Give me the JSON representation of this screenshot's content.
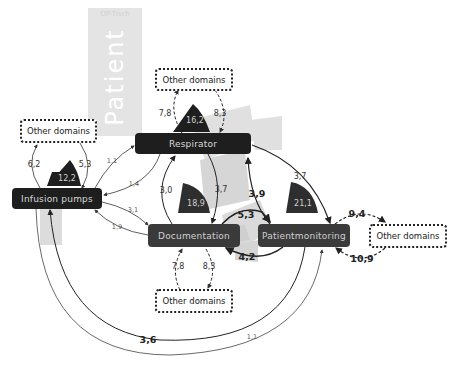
{
  "background_labels": {
    "patient": "Patient",
    "table": "OP-Tisch"
  },
  "nodes": {
    "infusion_pumps": "Infusion pumps",
    "respirator": "Respirator",
    "documentation": "Documentation",
    "patientmonitoring": "Patientmonitoring"
  },
  "other_domains": {
    "top": "Other domains",
    "left": "Other domains",
    "bottom": "Other domains",
    "right": "Other domains"
  },
  "self_values": {
    "infusion_pumps": "12,2",
    "respirator": "16,2",
    "documentation": "18,9",
    "patientmonitoring": "21,1"
  },
  "edges": {
    "other_to_respirator_out": "7,8",
    "other_to_respirator_in": "8,3",
    "infusion_to_other_out": "6,2",
    "infusion_from_other_in": "5,3",
    "infusion_to_respirator": "1,1",
    "respirator_to_infusion": "1,4",
    "infusion_to_documentation": "3,1",
    "documentation_to_infusion": "1,9",
    "documentation_to_respirator": "3,0",
    "respirator_to_documentation": "3,7",
    "patientmonitoring_to_respirator": "3,9",
    "respirator_to_patientmonitoring": "3,7",
    "documentation_to_patientmonitoring": "5,3",
    "patientmonitoring_to_documentation": "4,2",
    "documentation_to_other_out": "7,8",
    "documentation_from_other_in": "8,3",
    "patientmonitoring_to_other": "9,4",
    "other_to_patientmonitoring": "10,9",
    "patientmonitoring_to_infusion": "3,6",
    "infusion_to_patientmonitoring": "1,1"
  },
  "colors": {
    "node_dark": "#1e1e1e",
    "node_gray": "#3a3a3a",
    "background_shape": "#e4e4e4",
    "arrow": "#222222"
  }
}
